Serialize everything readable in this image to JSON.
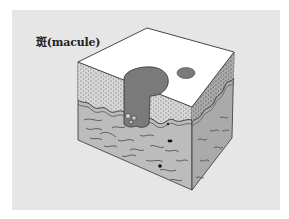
{
  "figure": {
    "title": "斑(macule)",
    "icons": [
      "skin-block-illustration"
    ],
    "colors": {
      "background_panel": "#e6e6e6",
      "top_surface": "#ffffff",
      "epidermis": "#d8d8d8",
      "dermis": "#b9b9b9",
      "right_face": "#a8a8a8",
      "pigment": "#7a7a7a",
      "outline": "#333333"
    }
  }
}
